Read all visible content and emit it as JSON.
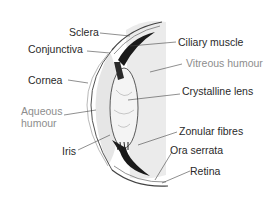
{
  "colors": {
    "label_dark": "#2a2a2a",
    "label_light": "#8d8d8d",
    "fluid_fill": "#e8e8e8",
    "outline": "#555555",
    "pigment": "#1a1a1a"
  },
  "labels": [
    {
      "id": "sclera",
      "text": "Sclera",
      "tone": "dark"
    },
    {
      "id": "conjunctiva",
      "text": "Conjunctiva",
      "tone": "dark"
    },
    {
      "id": "cornea",
      "text": "Cornea",
      "tone": "dark"
    },
    {
      "id": "aqueous_humour_line1",
      "text": "Aqueous",
      "tone": "light"
    },
    {
      "id": "aqueous_humour_line2",
      "text": "humour",
      "tone": "light"
    },
    {
      "id": "iris",
      "text": "Iris",
      "tone": "dark"
    },
    {
      "id": "ciliary_muscle",
      "text": "Ciliary muscle",
      "tone": "dark"
    },
    {
      "id": "vitreous_humour",
      "text": "Vitreous humour",
      "tone": "light"
    },
    {
      "id": "crystalline_lens",
      "text": "Crystalline lens",
      "tone": "dark"
    },
    {
      "id": "zonular_fibres",
      "text": "Zonular fibres",
      "tone": "dark"
    },
    {
      "id": "ora_serrata",
      "text": "Ora serrata",
      "tone": "dark"
    },
    {
      "id": "retina",
      "text": "Retina",
      "tone": "dark"
    }
  ]
}
